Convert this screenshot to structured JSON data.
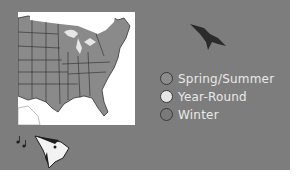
{
  "figure": {
    "type": "bird range map",
    "map_region": "Eastern United States",
    "colors": {
      "background": "#7d7d7d",
      "map_land_range": "#8a8a8a",
      "map_outside": "#ffffff",
      "state_borders": "#2a2a2a",
      "legend_text": "#e9e9e9"
    }
  },
  "legend": {
    "items": [
      {
        "label": "Spring/Summer",
        "color": "#8c8c8c"
      },
      {
        "label": "Year-Round",
        "color": "#e6e6e6"
      },
      {
        "label": "Winter",
        "color": "#7a7a7a"
      }
    ]
  },
  "icons": {
    "flying_bird": "flying-bird-silhouette",
    "bird_head": "singing-bird-head",
    "music_notes": "music-notes"
  }
}
